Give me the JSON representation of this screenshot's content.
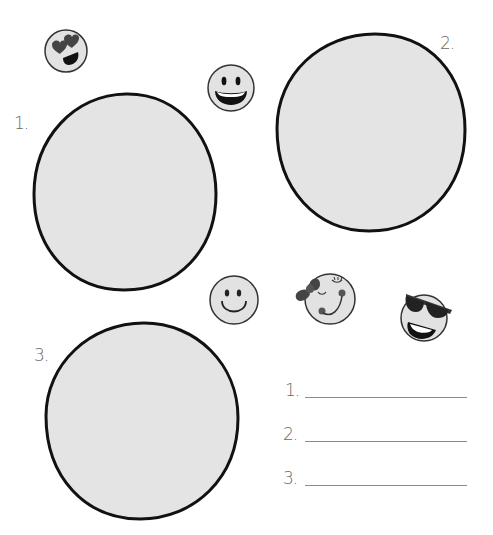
{
  "worksheet": {
    "circles": [
      {
        "label": "1.",
        "id": "circle-1"
      },
      {
        "label": "2.",
        "id": "circle-2"
      },
      {
        "label": "3.",
        "id": "circle-3"
      }
    ],
    "answers": [
      {
        "label": "1.",
        "value": ""
      },
      {
        "label": "2.",
        "value": ""
      },
      {
        "label": "3.",
        "value": ""
      }
    ],
    "emojis": [
      {
        "name": "heart-eyes-emoji-icon"
      },
      {
        "name": "grinning-emoji-icon"
      },
      {
        "name": "smiling-emoji-icon"
      },
      {
        "name": "winking-bow-emoji-icon"
      },
      {
        "name": "sunglasses-emoji-icon"
      }
    ],
    "colors": {
      "fill": "#e4e4e4",
      "outline": "#111111",
      "emoji_fill": "#e2e2e2",
      "emoji_dark": "#3a3a3a"
    }
  }
}
